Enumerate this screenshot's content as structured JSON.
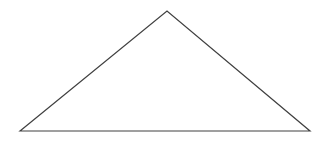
{
  "figure": {
    "background_color": "#ffffff",
    "canvas": {
      "width": 320,
      "height": 145
    },
    "shape": {
      "name": "triangle",
      "kind": "polygon",
      "fill": "none",
      "stroke_color": "#404040",
      "stroke_width": 1.2,
      "closed": true,
      "points_attr": "20,131 167,11 310,131",
      "vertices": [
        {
          "label": "bottom-left",
          "x": 20,
          "y": 131
        },
        {
          "label": "apex",
          "x": 167,
          "y": 11
        },
        {
          "label": "bottom-right",
          "x": 310,
          "y": 131
        }
      ],
      "edges": [
        {
          "label": "left-side",
          "from": "bottom-left",
          "to": "apex"
        },
        {
          "label": "right-side",
          "from": "apex",
          "to": "bottom-right"
        },
        {
          "label": "base",
          "from": "bottom-right",
          "to": "bottom-left"
        }
      ]
    }
  }
}
